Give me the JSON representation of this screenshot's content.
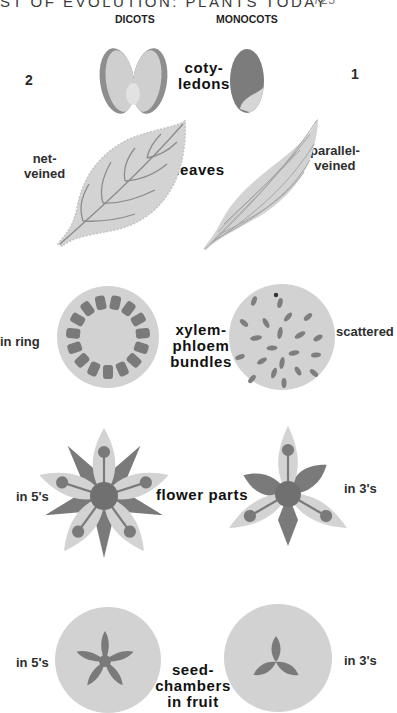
{
  "header": {
    "running_title": "ST OF EVOLUTION: PLANTS TODAY",
    "page_number": "725"
  },
  "columns": {
    "left": "DICOTS",
    "right": "MONOCOTS"
  },
  "rows": [
    {
      "feature": "coty-\nledons",
      "feature_lines": [
        "coty-",
        "ledons"
      ],
      "dicot": {
        "label": "2",
        "icon": "two-cotyledon-seed"
      },
      "monocot": {
        "label": "1",
        "icon": "one-cotyledon-seed"
      }
    },
    {
      "feature_lines": [
        "leaves"
      ],
      "dicot": {
        "label_lines": [
          "net-",
          "veined"
        ],
        "icon": "net-veined-leaf"
      },
      "monocot": {
        "label_lines": [
          "parallel-",
          "veined"
        ],
        "icon": "parallel-veined-leaf"
      }
    },
    {
      "feature_lines": [
        "xylem-",
        "phloem",
        "bundles"
      ],
      "dicot": {
        "label": "in ring",
        "icon": "stem-section-ring-bundles"
      },
      "monocot": {
        "label": "scattered",
        "icon": "stem-section-scattered-bundles"
      }
    },
    {
      "feature_lines": [
        "flower parts"
      ],
      "dicot": {
        "label": "in 5's",
        "icon": "five-part-flower"
      },
      "monocot": {
        "label": "in 3's",
        "icon": "three-part-flower"
      }
    },
    {
      "feature_lines": [
        "seed-",
        "chambers",
        "in fruit"
      ],
      "dicot": {
        "label": "in 5's",
        "icon": "five-chamber-fruit-section"
      },
      "monocot": {
        "label": "in 3's",
        "icon": "three-chamber-fruit-section"
      }
    }
  ],
  "colors": {
    "light_fill": "#d2d2d2",
    "mid_fill": "#bdbdbd",
    "dark_fill": "#7a7a7a",
    "vein": "#8a8a8a",
    "text": "#1a1a1a"
  }
}
